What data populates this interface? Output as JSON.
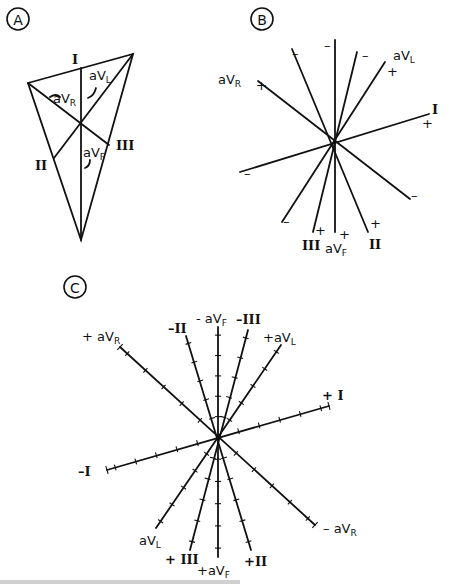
{
  "figure": {
    "panels": [
      {
        "id": "A",
        "label": "A",
        "badge": {
          "cx": 18,
          "cy": 19,
          "r": 11
        },
        "triangle": {
          "vertices": [
            [
              28,
              83
            ],
            [
              133,
              54
            ],
            [
              81,
              240
            ]
          ]
        },
        "center": [
          81,
          124
        ],
        "inner_lines": [
          {
            "name": "aVF-line",
            "from": [
              81,
              68
            ],
            "to": [
              81,
              240
            ]
          },
          {
            "name": "aVR-line",
            "from": [
              28,
              83
            ],
            "to": [
              109,
              145
            ]
          },
          {
            "name": "aVL-line",
            "from": [
              133,
              54
            ],
            "to": [
              54,
              158
            ]
          }
        ],
        "labels": [
          {
            "text": "I",
            "x": 72,
            "y": 64,
            "cls": "roman"
          },
          {
            "text": "aVL",
            "x": 89,
            "y": 80,
            "cls": "lbl",
            "sub": "L"
          },
          {
            "text": "aVR",
            "x": 53,
            "y": 103,
            "cls": "lbl",
            "sub": "R"
          },
          {
            "text": "aVF",
            "x": 83,
            "y": 157,
            "cls": "lbl",
            "sub": "F"
          },
          {
            "text": "III",
            "x": 116,
            "y": 150,
            "cls": "roman"
          },
          {
            "text": "II",
            "x": 35,
            "y": 170,
            "cls": "roman"
          }
        ]
      },
      {
        "id": "B",
        "label": "B",
        "badge": {
          "cx": 262,
          "cy": 19,
          "r": 11
        },
        "center": [
          335,
          141
        ],
        "axes": [
          {
            "name": "aVF",
            "from": [
              335,
              40
            ],
            "to": [
              335,
              232
            ]
          },
          {
            "name": "aVR",
            "from": [
              258,
              81
            ],
            "to": [
              410,
              199
            ]
          },
          {
            "name": "aVL",
            "from": [
              385,
              62
            ],
            "to": [
              282,
              222
            ]
          },
          {
            "name": "I",
            "from": [
              429,
              114
            ],
            "to": [
              240,
              172
            ]
          },
          {
            "name": "II",
            "from": [
              292,
              49
            ],
            "to": [
              368,
              232
            ]
          },
          {
            "name": "III",
            "from": [
              357,
              52
            ],
            "to": [
              313,
              232
            ]
          }
        ],
        "labels": [
          {
            "text": "aVR",
            "x": 218,
            "y": 84,
            "cls": "lbl",
            "sub": "R"
          },
          {
            "text": "+",
            "x": 256,
            "y": 90,
            "cls": "lbl"
          },
          {
            "text": "–",
            "x": 292,
            "y": 58,
            "cls": "lbl"
          },
          {
            "text": "–",
            "x": 324,
            "y": 50,
            "cls": "lbl"
          },
          {
            "text": "–",
            "x": 362,
            "y": 60,
            "cls": "lbl"
          },
          {
            "text": "aVL",
            "x": 393,
            "y": 60,
            "cls": "lbl",
            "sub": "L"
          },
          {
            "text": "+",
            "x": 387,
            "y": 76,
            "cls": "lbl"
          },
          {
            "text": "I",
            "x": 432,
            "y": 114,
            "cls": "roman"
          },
          {
            "text": "+",
            "x": 422,
            "y": 128,
            "cls": "lbl"
          },
          {
            "text": "–",
            "x": 244,
            "y": 178,
            "cls": "lbl"
          },
          {
            "text": "–",
            "x": 411,
            "y": 200,
            "cls": "lbl"
          },
          {
            "text": "–",
            "x": 283,
            "y": 226,
            "cls": "lbl"
          },
          {
            "text": "+",
            "x": 315,
            "y": 235,
            "cls": "lbl"
          },
          {
            "text": "+",
            "x": 339,
            "y": 239,
            "cls": "lbl"
          },
          {
            "text": "+",
            "x": 370,
            "y": 228,
            "cls": "lbl"
          },
          {
            "text": "III",
            "x": 302,
            "y": 250,
            "cls": "roman"
          },
          {
            "text": "aVF",
            "x": 325,
            "y": 253,
            "cls": "lbl",
            "sub": "F"
          },
          {
            "text": "II",
            "x": 369,
            "y": 249,
            "cls": "roman"
          }
        ]
      },
      {
        "id": "C",
        "label": "C",
        "badge": {
          "cx": 75,
          "cy": 287,
          "r": 11
        },
        "center": [
          218,
          437
        ],
        "ticks_per_half": 5,
        "axes": [
          {
            "name": "aVF",
            "from": [
              218,
              327
            ],
            "to": [
              218,
              557
            ],
            "end_bars": false
          },
          {
            "name": "aVR",
            "from": [
              120,
              347
            ],
            "to": [
              315,
              525
            ],
            "end_bars": true
          },
          {
            "name": "I",
            "from": [
              107,
              470
            ],
            "to": [
              329,
              406
            ],
            "end_bars": true
          },
          {
            "name": "aVL",
            "from": [
              156,
              528
            ],
            "to": [
              281,
              345
            ],
            "end_bars": false
          },
          {
            "name": "III",
            "from": [
              190,
              550
            ],
            "to": [
              248,
              330
            ],
            "end_bars": false
          },
          {
            "name": "II",
            "from": [
              186,
              336
            ],
            "to": [
              251,
              550
            ],
            "end_bars": false
          }
        ],
        "labels": [
          {
            "text": "+ aVR",
            "x": 82,
            "y": 341,
            "cls": "lbl",
            "sub": "R"
          },
          {
            "text": "–II",
            "x": 168,
            "y": 333,
            "cls": "roman"
          },
          {
            "text": "- aVF",
            "x": 196,
            "y": 323,
            "cls": "lbl",
            "sub": "F"
          },
          {
            "text": "–III",
            "x": 236,
            "y": 324,
            "cls": "roman"
          },
          {
            "text": "+aVL",
            "x": 263,
            "y": 342,
            "cls": "lbl",
            "sub": "L"
          },
          {
            "text": "+ I",
            "x": 322,
            "y": 400,
            "cls": "roman"
          },
          {
            "text": "–I",
            "x": 78,
            "y": 476,
            "cls": "roman"
          },
          {
            "text": "– aVR",
            "x": 323,
            "y": 533,
            "cls": "lbl",
            "sub": "R"
          },
          {
            "text": "aVL",
            "x": 139,
            "y": 545,
            "cls": "lbl",
            "sub": "L"
          },
          {
            "text": "+ III",
            "x": 165,
            "y": 564,
            "cls": "roman"
          },
          {
            "text": "+aVF",
            "x": 197,
            "y": 575,
            "cls": "lbl",
            "sub": "F"
          },
          {
            "text": "+II",
            "x": 244,
            "y": 566,
            "cls": "roman"
          }
        ]
      }
    ],
    "caption": ""
  }
}
